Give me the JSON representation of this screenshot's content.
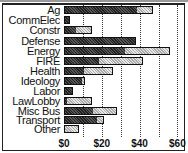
{
  "chart_data": {
    "type": "bar",
    "orientation": "horizontal",
    "stacked": true,
    "title": "",
    "xlabel": "",
    "ylabel": "",
    "xlim": [
      0,
      60
    ],
    "x_ticks": [
      "$0",
      "$20",
      "$40",
      "$60"
    ],
    "grid": "vertical dotted every $10",
    "categories": [
      "Ag",
      "CommElec",
      "Constr",
      "Defense",
      "Energy",
      "FIRE",
      "Health",
      "Ideology",
      "Labor",
      "LawLobby",
      "Misc Bus",
      "Transport",
      "Other"
    ],
    "series": [
      {
        "name": "dark",
        "color": "#333333",
        "values": [
          38,
          2,
          6,
          38,
          32,
          18,
          10,
          9,
          5,
          1,
          15,
          17,
          0
        ]
      },
      {
        "name": "light",
        "color": "#cccccc",
        "values": [
          9,
          1,
          9,
          0,
          24,
          24,
          16,
          2,
          0,
          14,
          13,
          4,
          8
        ]
      }
    ],
    "totals": [
      47,
      3,
      15,
      38,
      56,
      42,
      26,
      11,
      5,
      15,
      28,
      21,
      8
    ]
  }
}
